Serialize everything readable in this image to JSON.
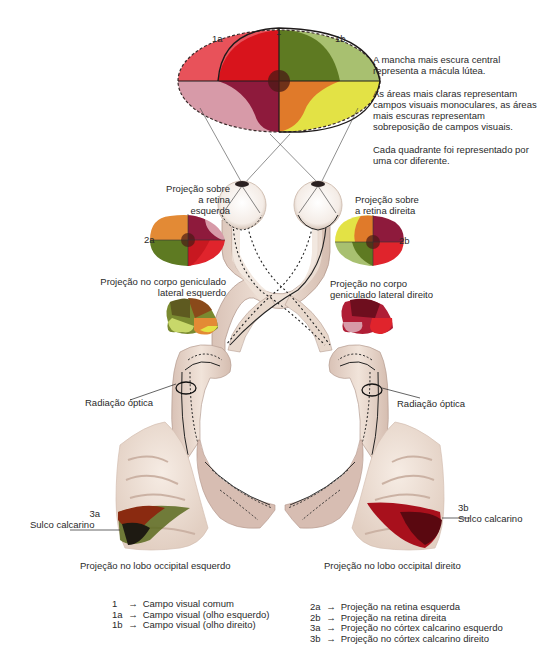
{
  "visual_field": {
    "label_common": "1",
    "label_left": "1a",
    "label_right": "1b"
  },
  "notes": [
    "A mancha mais escura central representa a mácula lútea.",
    "As áreas mais claras representam campos visuais monoculares, as áreas mais escuras representam sobreposição de campos visuais.",
    "Cada quadrante foi representado por uma cor diferente."
  ],
  "labels": {
    "retina_left": [
      "Projeção sobre",
      "a retina",
      "esquerda"
    ],
    "retina_right": [
      "Projeção sobre",
      "a retina direita"
    ],
    "retina_left_code": "2a",
    "retina_right_code": "2b",
    "lgn_left": [
      "Projeção no corpo geniculado",
      "lateral esquerdo"
    ],
    "lgn_right": [
      "Projeção no corpo",
      "geniculado lateral direito"
    ],
    "optic_radiation_left": "Radiação óptica",
    "optic_radiation_right": "Radiação óptica",
    "cortex_left_code": "3a",
    "cortex_left_sulcus": "Sulco calcarino",
    "cortex_right_code": "3b",
    "cortex_right_sulcus": "Sulco calcarino",
    "occipital_left": "Projeção no lobo occipital esquerdo",
    "occipital_right": "Projeção no lobo occipital direito"
  },
  "legend_left": [
    {
      "key": "1",
      "text": "Campo visual comum"
    },
    {
      "key": "1a",
      "text": "Campo visual (olho esquerdo)"
    },
    {
      "key": "1b",
      "text": "Campo visual (olho direito)"
    }
  ],
  "legend_right": [
    {
      "key": "2a",
      "text": "Projeção na retina esquerda"
    },
    {
      "key": "2b",
      "text": "Projeção na retina direita"
    },
    {
      "key": "3a",
      "text": "Projeção no córtex calcarino esquerdo"
    },
    {
      "key": "3b",
      "text": "Projeção no córtex calcarino direito"
    }
  ],
  "legend_arrow": "→",
  "colors": {
    "upper_left": "#d8141c",
    "upper_right": "#5e7a22",
    "lower_left": "#8e1a3c",
    "lower_right": "#e07a2a",
    "light_pink": "#d79aa8",
    "light_red": "#e8525a",
    "light_green": "#a8c070",
    "light_yellow": "#e3e245",
    "macula": "#4a1a14",
    "tissue": "#ecdcd2",
    "tissue_dark": "#c8aaa0"
  }
}
